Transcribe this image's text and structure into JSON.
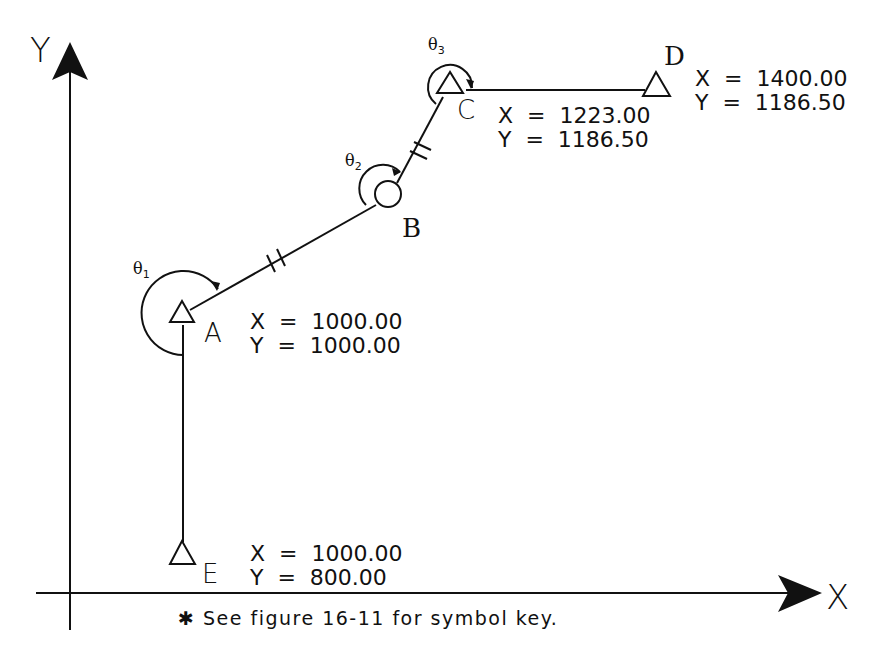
{
  "axes": {
    "x_label": "X",
    "y_label": "Y"
  },
  "points": {
    "A": {
      "label": "A",
      "symbol": "triangle",
      "x_text": "X  =  1000.00",
      "y_text": "Y  =  1000.00",
      "x": 1000.0,
      "y": 1000.0
    },
    "B": {
      "label": "B",
      "symbol": "circle"
    },
    "C": {
      "label": "C",
      "symbol": "triangle",
      "x_text": "X  =  1223.00",
      "y_text": "Y  =  1186.50",
      "x": 1223.0,
      "y": 1186.5
    },
    "D": {
      "label": "D",
      "symbol": "triangle",
      "x_text": "X  =  1400.00",
      "y_text": "Y  =  1186.50",
      "x": 1400.0,
      "y": 1186.5
    },
    "E": {
      "label": "E",
      "symbol": "triangle",
      "x_text": "X  =  1000.00",
      "y_text": "Y  =  800.00",
      "x": 1000.0,
      "y": 800.0
    }
  },
  "angles": {
    "theta1": {
      "symbol": "θ",
      "sub": "1"
    },
    "theta2": {
      "symbol": "θ",
      "sub": "2"
    },
    "theta3": {
      "symbol": "θ",
      "sub": "3"
    }
  },
  "lines": [
    {
      "from": "E",
      "to": "A"
    },
    {
      "from": "A",
      "to": "B",
      "break_marks": true
    },
    {
      "from": "B",
      "to": "C",
      "break_marks": true
    },
    {
      "from": "C",
      "to": "D"
    }
  ],
  "footnote": "✱ See figure 16-11 for symbol key.",
  "colors": {
    "ink": "#111111",
    "background": "#ffffff"
  }
}
